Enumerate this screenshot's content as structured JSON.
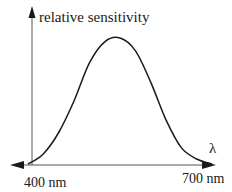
{
  "chart_data": {
    "type": "line",
    "title": "",
    "xlabel": "λ",
    "ylabel": "relative sensitivity",
    "tick_labels": {
      "x_min": "400 nm",
      "x_max": "700 nm"
    },
    "xlim": [
      400,
      700
    ],
    "ylim": [
      0,
      1
    ],
    "grid": false,
    "legend": null,
    "series": [
      {
        "name": "relative sensitivity",
        "x": [
          400,
          425,
          450,
          475,
          500,
          525,
          550,
          575,
          600,
          625,
          650,
          675,
          700
        ],
        "values": [
          0.0,
          0.08,
          0.25,
          0.5,
          0.8,
          0.97,
          1.0,
          0.9,
          0.65,
          0.35,
          0.13,
          0.04,
          0.0
        ]
      }
    ]
  },
  "labels": {
    "y_axis": "relative sensitivity",
    "x_axis": "λ",
    "x_start": "400 nm",
    "x_end": "700 nm"
  },
  "colors": {
    "ink": "#1a1a1a",
    "axis": "#555555",
    "background": "#ffffff"
  }
}
